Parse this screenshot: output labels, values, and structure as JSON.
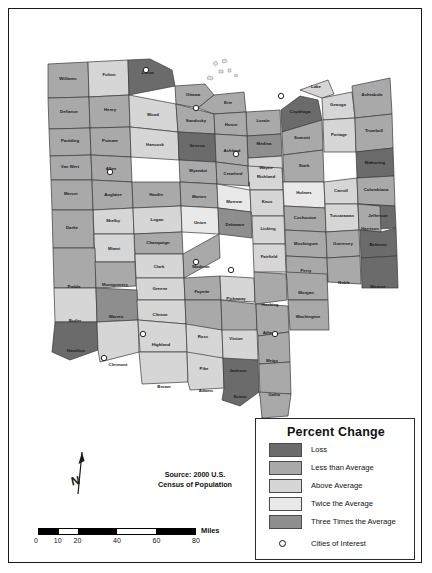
{
  "map": {
    "title": "Ohio Counties Percent Change Map",
    "state": "Ohio",
    "source_note_line1": "Source: 2000 U.S.",
    "source_note_line2": "Census of Population",
    "north_label": "N",
    "water_color": "#ffffff",
    "outline_color": "#3a3a3a"
  },
  "legend": {
    "title": "Percent Change",
    "items": [
      {
        "label": "Loss",
        "color": "#6b6b6b"
      },
      {
        "label": "Less than Average",
        "color": "#a9a9a9"
      },
      {
        "label": "Above Average",
        "color": "#d6d6d6"
      },
      {
        "label": "Twice the Average",
        "color": "#e9e9e9"
      },
      {
        "label": "Three Times the Average",
        "color": "#8e8e8e"
      }
    ],
    "cities_label": "Cities of Interest",
    "cities_symbol": "circle"
  },
  "scale": {
    "unit": "Miles",
    "ticks": [
      "0",
      "10",
      "20",
      "40",
      "60",
      "80"
    ]
  },
  "chart_data": {
    "type": "map",
    "title": "Percent Change",
    "subtitle": "Source: 2000 U.S. Census of Population",
    "legend_position": "bottom-right",
    "classes": [
      "Loss",
      "Less than Average",
      "Above Average",
      "Twice the Average",
      "Three Times the Average"
    ],
    "class_colors": [
      "#6b6b6b",
      "#a9a9a9",
      "#d6d6d6",
      "#e9e9e9",
      "#8e8e8e"
    ],
    "cities_of_interest": [
      "Toledo",
      "Cleveland",
      "Akron",
      "Columbus",
      "Cincinnati",
      "Dayton",
      "Lima",
      "Chillicothe",
      "Athens",
      "Sandusky"
    ],
    "counties": [
      {
        "name": "Williams",
        "class": "Less than Average"
      },
      {
        "name": "Fulton",
        "class": "Above Average"
      },
      {
        "name": "Lucas",
        "class": "Loss"
      },
      {
        "name": "Ottawa",
        "class": "Less than Average"
      },
      {
        "name": "Erie",
        "class": "Less than Average"
      },
      {
        "name": "Lorain",
        "class": "Less than Average"
      },
      {
        "name": "Cuyahoga",
        "class": "Loss"
      },
      {
        "name": "Lake",
        "class": "Above Average"
      },
      {
        "name": "Geauga",
        "class": "Above Average"
      },
      {
        "name": "Ashtabula",
        "class": "Less than Average"
      },
      {
        "name": "Defiance",
        "class": "Less than Average"
      },
      {
        "name": "Henry",
        "class": "Less than Average"
      },
      {
        "name": "Wood",
        "class": "Above Average"
      },
      {
        "name": "Sandusky",
        "class": "Less than Average"
      },
      {
        "name": "Huron",
        "class": "Less than Average"
      },
      {
        "name": "Medina",
        "class": "Three Times the Average"
      },
      {
        "name": "Summit",
        "class": "Less than Average"
      },
      {
        "name": "Portage",
        "class": "Above Average"
      },
      {
        "name": "Trumbull",
        "class": "Less than Average"
      },
      {
        "name": "Paulding",
        "class": "Less than Average"
      },
      {
        "name": "Putnam",
        "class": "Less than Average"
      },
      {
        "name": "Hancock",
        "class": "Above Average"
      },
      {
        "name": "Seneca",
        "class": "Loss"
      },
      {
        "name": "Ashland",
        "class": "Less than Average"
      },
      {
        "name": "Wayne",
        "class": "Above Average"
      },
      {
        "name": "Stark",
        "class": "Less than Average"
      },
      {
        "name": "Mahoning",
        "class": "Loss"
      },
      {
        "name": "Van Wert",
        "class": "Less than Average"
      },
      {
        "name": "Allen",
        "class": "Less than Average"
      },
      {
        "name": "Wyandot",
        "class": "Less than Average"
      },
      {
        "name": "Crawford",
        "class": "Less than Average"
      },
      {
        "name": "Richland",
        "class": "Above Average"
      },
      {
        "name": "Holmes",
        "class": "Twice the Average"
      },
      {
        "name": "Carroll",
        "class": "Above Average"
      },
      {
        "name": "Columbiana",
        "class": "Less than Average"
      },
      {
        "name": "Mercer",
        "class": "Less than Average"
      },
      {
        "name": "Auglaize",
        "class": "Less than Average"
      },
      {
        "name": "Hardin",
        "class": "Less than Average"
      },
      {
        "name": "Marion",
        "class": "Less than Average"
      },
      {
        "name": "Morrow",
        "class": "Twice the Average"
      },
      {
        "name": "Knox",
        "class": "Above Average"
      },
      {
        "name": "Coshocton",
        "class": "Less than Average"
      },
      {
        "name": "Tuscarawas",
        "class": "Above Average"
      },
      {
        "name": "Jefferson",
        "class": "Loss"
      },
      {
        "name": "Harrison",
        "class": "Less than Average"
      },
      {
        "name": "Shelby",
        "class": "Above Average"
      },
      {
        "name": "Logan",
        "class": "Above Average"
      },
      {
        "name": "Union",
        "class": "Twice the Average"
      },
      {
        "name": "Delaware",
        "class": "Three Times the Average"
      },
      {
        "name": "Licking",
        "class": "Above Average"
      },
      {
        "name": "Muskingum",
        "class": "Less than Average"
      },
      {
        "name": "Guernsey",
        "class": "Less than Average"
      },
      {
        "name": "Belmont",
        "class": "Loss"
      },
      {
        "name": "Darke",
        "class": "Less than Average"
      },
      {
        "name": "Miami",
        "class": "Above Average"
      },
      {
        "name": "Champaign",
        "class": "Less than Average"
      },
      {
        "name": "Clark",
        "class": "Above Average"
      },
      {
        "name": "Madison",
        "class": "Less than Average"
      },
      {
        "name": "Fairfield",
        "class": "Above Average"
      },
      {
        "name": "Perry",
        "class": "Less than Average"
      },
      {
        "name": "Morgan",
        "class": "Less than Average"
      },
      {
        "name": "Noble",
        "class": "Less than Average"
      },
      {
        "name": "Monroe",
        "class": "Loss"
      },
      {
        "name": "Preble",
        "class": "Less than Average"
      },
      {
        "name": "Montgomery",
        "class": "Less than Average"
      },
      {
        "name": "Greene",
        "class": "Above Average"
      },
      {
        "name": "Fayette",
        "class": "Less than Average"
      },
      {
        "name": "Pickaway",
        "class": "Above Average"
      },
      {
        "name": "Hocking",
        "class": "Less than Average"
      },
      {
        "name": "Washington",
        "class": "Less than Average"
      },
      {
        "name": "Butler",
        "class": "Above Average"
      },
      {
        "name": "Warren",
        "class": "Three Times the Average"
      },
      {
        "name": "Clinton",
        "class": "Above Average"
      },
      {
        "name": "Ross",
        "class": "Less than Average"
      },
      {
        "name": "Vinton",
        "class": "Less than Average"
      },
      {
        "name": "Athens",
        "class": "Less than Average"
      },
      {
        "name": "Hamilton",
        "class": "Loss"
      },
      {
        "name": "Clermont",
        "class": "Above Average"
      },
      {
        "name": "Highland",
        "class": "Above Average"
      },
      {
        "name": "Pike",
        "class": "Above Average"
      },
      {
        "name": "Jackson",
        "class": "Above Average"
      },
      {
        "name": "Meigs",
        "class": "Less than Average"
      },
      {
        "name": "Brown",
        "class": "Above Average"
      },
      {
        "name": "Adams",
        "class": "Above Average"
      },
      {
        "name": "Scioto",
        "class": "Loss"
      },
      {
        "name": "Gallia",
        "class": "Less than Average"
      },
      {
        "name": "Lawrence",
        "class": "Less than Average"
      }
    ]
  }
}
